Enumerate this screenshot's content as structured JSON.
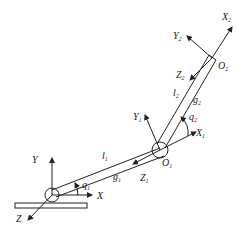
{
  "diagram": {
    "base_frame": {
      "x": "X",
      "y": "Y",
      "z": "Z"
    },
    "joint1": {
      "origin": "O",
      "origin_sub": "1",
      "x": "X",
      "x_sub": "1",
      "y": "Y",
      "y_sub": "1",
      "z": "Z",
      "z_sub": "1",
      "angle": "q",
      "angle_sub": "2"
    },
    "joint2": {
      "origin": "O",
      "origin_sub": "2",
      "x": "X",
      "x_sub": "2",
      "y": "Y",
      "y_sub": "2",
      "z": "Z",
      "z_sub": "2"
    },
    "base_angle": {
      "sym": "q",
      "sub": "1"
    },
    "link1": {
      "l": "l",
      "l_sub": "1",
      "g": "g",
      "g_sub": "1"
    },
    "link2": {
      "l": "l",
      "l_sub": "2",
      "g": "g",
      "g_sub": "2"
    },
    "colors": {
      "stroke": "#222222",
      "background": "#ffffff"
    }
  }
}
